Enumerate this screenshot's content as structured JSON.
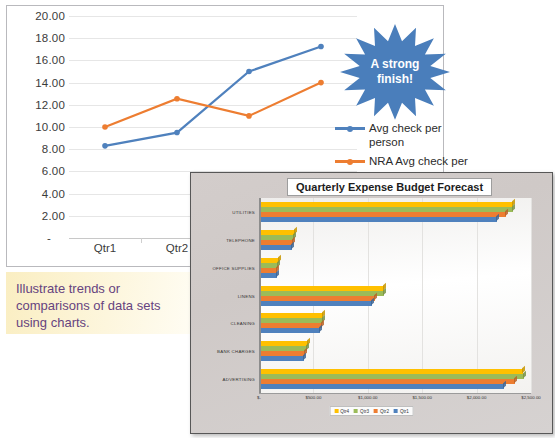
{
  "line_chart": {
    "y_ticks": [
      "20.00",
      "18.00",
      "16.00",
      "14.00",
      "12.00",
      "10.00",
      "8.00",
      "6.00",
      "4.00",
      "2.00"
    ],
    "zero_label": "-",
    "x_labels": [
      "Qtr1",
      "Qtr2",
      "Qtr3",
      "Qtr4"
    ],
    "legend": [
      {
        "label": "Avg check per person",
        "color": "#4f81bd"
      },
      {
        "label": "NRA Avg check per person",
        "color": "#ed7d31"
      }
    ]
  },
  "callout": {
    "line1": "A strong",
    "line2": "finish!",
    "color": "#4a7ebb"
  },
  "caption": {
    "text": "Illustrate trends or comparisons of data sets using charts."
  },
  "bar_chart_ui": {
    "title": "Quarterly Expense Budget Forecast",
    "legend": [
      {
        "label": "Qtr4",
        "color": "#ffc000"
      },
      {
        "label": "Qtr3",
        "color": "#9bbb59"
      },
      {
        "label": "Qtr2",
        "color": "#ed7d31"
      },
      {
        "label": "Qtr1",
        "color": "#4f81bd"
      }
    ]
  },
  "chart_data": [
    {
      "type": "line",
      "title": "",
      "xlabel": "",
      "ylabel": "",
      "categories": [
        "Qtr1",
        "Qtr2",
        "Qtr3",
        "Qtr4"
      ],
      "ylim": [
        0,
        20
      ],
      "y_ticks": [
        0,
        2,
        4,
        6,
        8,
        10,
        12,
        14,
        16,
        18,
        20
      ],
      "grid": true,
      "legend_position": "right",
      "series": [
        {
          "name": "Avg check per person",
          "color": "#4f81bd",
          "values": [
            8.3,
            9.5,
            15.0,
            17.25
          ]
        },
        {
          "name": "NRA Avg check per person",
          "color": "#ed7d31",
          "values": [
            10.0,
            12.55,
            11.0,
            14.0
          ]
        }
      ]
    },
    {
      "type": "bar",
      "orientation": "horizontal",
      "title": "Quarterly Expense Budget Forecast",
      "xlabel": "",
      "ylabel": "",
      "categories": [
        "UTILITIES",
        "TELEPHONE",
        "OFFICE SUPPLIES",
        "LINENS",
        "CLEANING",
        "BANK CHARGES",
        "ADVERTISING"
      ],
      "xlim": [
        0,
        2500
      ],
      "x_ticks": [
        0,
        500,
        1000,
        1500,
        2000,
        2500
      ],
      "x_tick_labels": [
        "$-",
        "$500.00",
        "$1,000.00",
        "$1,500.00",
        "$2,000.00",
        "$2,500.00"
      ],
      "grid": true,
      "legend_position": "bottom",
      "series": [
        {
          "name": "Qtr4",
          "color": "#ffc000",
          "values": [
            2330,
            330,
            180,
            1150,
            590,
            450,
            2425
          ]
        },
        {
          "name": "Qtr3",
          "color": "#9bbb59",
          "values": [
            2335,
            320,
            175,
            1145,
            585,
            445,
            2440
          ]
        },
        {
          "name": "Qtr2",
          "color": "#ed7d31",
          "values": [
            2270,
            315,
            170,
            1065,
            575,
            420,
            2355
          ]
        },
        {
          "name": "Qtr1",
          "color": "#4f81bd",
          "values": [
            2185,
            305,
            165,
            1040,
            560,
            415,
            2250
          ]
        }
      ]
    }
  ]
}
